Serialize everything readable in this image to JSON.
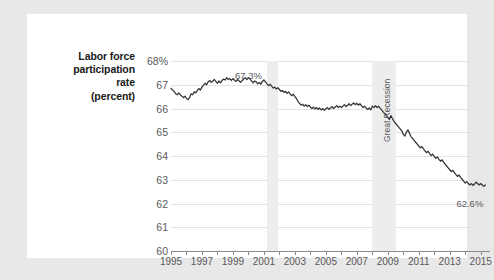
{
  "figure": {
    "background_color": "#ffffff",
    "page_background_color": "#e8e8e8",
    "axis_title_lines": [
      "Labor force",
      "participation",
      "rate",
      "(percent)"
    ]
  },
  "chart_data": {
    "type": "line",
    "title": "",
    "xlabel": "",
    "ylabel": "Labor force participation rate (percent)",
    "xlim": [
      1995,
      2015.6
    ],
    "ylim": [
      60,
      68
    ],
    "grid": true,
    "legend": "none",
    "line_color": "#333333",
    "ytick_labels": [
      "68%",
      "67",
      "66",
      "65",
      "64",
      "63",
      "62",
      "61",
      "60"
    ],
    "ytick_values": [
      68,
      67,
      66,
      65,
      64,
      63,
      62,
      61,
      60
    ],
    "xtick_labels": [
      "1995",
      "1997",
      "1999",
      "2001",
      "2003",
      "2005",
      "2007",
      "2009",
      "2011",
      "2013",
      "2015"
    ],
    "xtick_values": [
      1995,
      1997,
      1999,
      2001,
      2003,
      2005,
      2007,
      2009,
      2011,
      2013,
      2015
    ],
    "xtick_minor_values": [
      1996,
      1998,
      2000,
      2002,
      2004,
      2006,
      2008,
      2010,
      2012,
      2014
    ],
    "annotations": [
      {
        "name": "peak-label",
        "text": "67.3%",
        "x": 2000.0,
        "y": 67.62
      },
      {
        "name": "end-label",
        "text": "62.6%",
        "x": 2014.3,
        "y": 62.22
      },
      {
        "name": "recession-band-label",
        "text": "Great Recession",
        "x": 2008.6,
        "y": 64.6
      }
    ],
    "shaded_regions": [
      {
        "name": "recession-2001",
        "label": "",
        "x_start": 2001.2,
        "x_end": 2001.9,
        "color": "#ededed"
      },
      {
        "name": "great-recession",
        "label": "Great Recession",
        "x_start": 2007.95,
        "x_end": 2009.5,
        "color": "#ededed"
      }
    ],
    "series": [
      {
        "name": "Labor force participation rate",
        "x": [
          1995.0,
          1995.1,
          1995.2,
          1995.3,
          1995.4,
          1995.5,
          1995.6,
          1995.7,
          1995.8,
          1995.9,
          1996.0,
          1996.1,
          1996.2,
          1996.3,
          1996.4,
          1996.5,
          1996.6,
          1996.7,
          1996.8,
          1996.9,
          1997.0,
          1997.1,
          1997.2,
          1997.3,
          1997.4,
          1997.5,
          1997.6,
          1997.7,
          1997.8,
          1997.9,
          1998.0,
          1998.1,
          1998.2,
          1998.3,
          1998.4,
          1998.5,
          1998.6,
          1998.7,
          1998.8,
          1998.9,
          1999.0,
          1999.1,
          1999.2,
          1999.3,
          1999.4,
          1999.5,
          1999.6,
          1999.7,
          1999.8,
          1999.9,
          2000.0,
          2000.1,
          2000.2,
          2000.3,
          2000.4,
          2000.5,
          2000.6,
          2000.7,
          2000.8,
          2000.9,
          2001.0,
          2001.1,
          2001.2,
          2001.3,
          2001.4,
          2001.5,
          2001.6,
          2001.7,
          2001.8,
          2001.9,
          2002.0,
          2002.1,
          2002.2,
          2002.3,
          2002.4,
          2002.5,
          2002.6,
          2002.7,
          2002.8,
          2002.9,
          2003.0,
          2003.1,
          2003.2,
          2003.3,
          2003.4,
          2003.5,
          2003.6,
          2003.7,
          2003.8,
          2003.9,
          2004.0,
          2004.1,
          2004.2,
          2004.3,
          2004.4,
          2004.5,
          2004.6,
          2004.7,
          2004.8,
          2004.9,
          2005.0,
          2005.1,
          2005.2,
          2005.3,
          2005.4,
          2005.5,
          2005.6,
          2005.7,
          2005.8,
          2005.9,
          2006.0,
          2006.1,
          2006.2,
          2006.3,
          2006.4,
          2006.5,
          2006.6,
          2006.7,
          2006.8,
          2006.9,
          2007.0,
          2007.1,
          2007.2,
          2007.3,
          2007.4,
          2007.5,
          2007.6,
          2007.7,
          2007.8,
          2007.9,
          2008.0,
          2008.1,
          2008.2,
          2008.3,
          2008.4,
          2008.5,
          2008.6,
          2008.7,
          2008.8,
          2008.9,
          2009.0,
          2009.1,
          2009.2,
          2009.3,
          2009.4,
          2009.5,
          2009.6,
          2009.7,
          2009.8,
          2009.9,
          2010.0,
          2010.1,
          2010.2,
          2010.3,
          2010.4,
          2010.5,
          2010.6,
          2010.7,
          2010.8,
          2010.9,
          2011.0,
          2011.1,
          2011.2,
          2011.3,
          2011.4,
          2011.5,
          2011.6,
          2011.7,
          2011.8,
          2011.9,
          2012.0,
          2012.1,
          2012.2,
          2012.3,
          2012.4,
          2012.5,
          2012.6,
          2012.7,
          2012.8,
          2012.9,
          2013.0,
          2013.1,
          2013.2,
          2013.3,
          2013.4,
          2013.5,
          2013.6,
          2013.7,
          2013.8,
          2013.9,
          2014.0,
          2014.1,
          2014.2,
          2014.3,
          2014.4,
          2014.5,
          2014.6,
          2014.7,
          2014.8,
          2014.9,
          2015.0,
          2015.1,
          2015.2,
          2015.3
        ],
        "y": [
          66.85,
          66.78,
          66.72,
          66.62,
          66.58,
          66.66,
          66.58,
          66.52,
          66.46,
          66.52,
          66.42,
          66.38,
          66.46,
          66.62,
          66.58,
          66.7,
          66.66,
          66.76,
          66.84,
          66.78,
          66.9,
          66.98,
          67.06,
          67.0,
          67.12,
          67.18,
          67.1,
          67.16,
          67.22,
          67.14,
          67.06,
          67.16,
          67.08,
          67.18,
          67.24,
          67.2,
          67.3,
          67.22,
          67.26,
          67.18,
          67.26,
          67.2,
          67.14,
          67.22,
          67.16,
          67.1,
          67.18,
          67.24,
          67.3,
          67.22,
          67.3,
          67.24,
          67.16,
          67.08,
          67.16,
          67.12,
          67.04,
          67.1,
          67.02,
          67.14,
          67.2,
          67.12,
          67.04,
          66.96,
          67.02,
          66.94,
          66.86,
          66.9,
          66.82,
          66.88,
          66.8,
          66.72,
          66.76,
          66.68,
          66.72,
          66.64,
          66.7,
          66.6,
          66.54,
          66.6,
          66.5,
          66.42,
          66.3,
          66.22,
          66.14,
          66.18,
          66.1,
          66.16,
          66.08,
          66.14,
          66.06,
          66.0,
          66.06,
          65.98,
          66.04,
          65.96,
          66.02,
          65.94,
          66.0,
          65.92,
          65.98,
          66.04,
          65.96,
          66.02,
          66.08,
          66.0,
          66.06,
          66.12,
          66.04,
          66.1,
          66.04,
          66.1,
          66.16,
          66.08,
          66.14,
          66.2,
          66.12,
          66.18,
          66.24,
          66.16,
          66.22,
          66.14,
          66.2,
          66.12,
          66.04,
          66.1,
          66.02,
          65.96,
          66.02,
          65.94,
          66.1,
          66.04,
          66.12,
          66.04,
          66.1,
          66.02,
          65.94,
          65.86,
          65.78,
          65.7,
          65.62,
          65.54,
          65.7,
          65.58,
          65.46,
          65.38,
          65.3,
          65.22,
          65.14,
          65.06,
          64.92,
          64.84,
          65.0,
          65.1,
          64.96,
          64.82,
          64.74,
          64.66,
          64.58,
          64.5,
          64.42,
          64.34,
          64.4,
          64.3,
          64.22,
          64.14,
          64.2,
          64.1,
          64.02,
          64.08,
          63.98,
          63.9,
          63.96,
          63.86,
          63.78,
          63.84,
          63.74,
          63.66,
          63.58,
          63.5,
          63.42,
          63.34,
          63.4,
          63.3,
          63.22,
          63.14,
          63.2,
          63.1,
          63.02,
          62.94,
          62.86,
          62.92,
          62.84,
          62.78,
          62.84,
          62.76,
          62.82,
          62.9,
          62.84,
          62.78,
          62.84,
          62.78,
          62.72,
          62.78
        ]
      }
    ]
  }
}
